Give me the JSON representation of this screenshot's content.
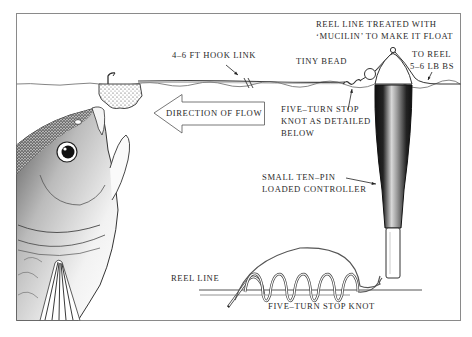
{
  "diagram": {
    "type": "angling-rig-illustration",
    "colors": {
      "ink": "#2a2a2a",
      "frame": "#8a8a8a",
      "background": "#ffffff"
    },
    "labels": {
      "hook_link": "4–6 FT HOOK LINK",
      "reel_line_treated_line1": "REEL LINE TREATED WITH",
      "reel_line_treated_line2": "‘MUCILIN’ TO MAKE IT FLOAT",
      "tiny_bead": "TINY BEAD",
      "to_reel": "TO REEL",
      "line_strength": "5–6 LB BS",
      "direction_of_flow": "DIRECTION OF FLOW",
      "stop_knot_line1": "FIVE–TURN STOP",
      "stop_knot_line2": "KNOT AS DETAILED",
      "stop_knot_line3": "BELOW",
      "controller_line1": "SMALL TEN–PIN",
      "controller_line2": "LOADED CONTROLLER",
      "reel_line": "REEL LINE",
      "knot_caption": "FIVE–TURN STOP KNOT"
    },
    "elements": [
      "fish-head",
      "bread-crust-bait",
      "hook",
      "hook-link-line",
      "water-surface",
      "stop-knot",
      "tiny-bead",
      "ten-pin-controller-float",
      "direction-arrow",
      "knot-detail"
    ]
  }
}
